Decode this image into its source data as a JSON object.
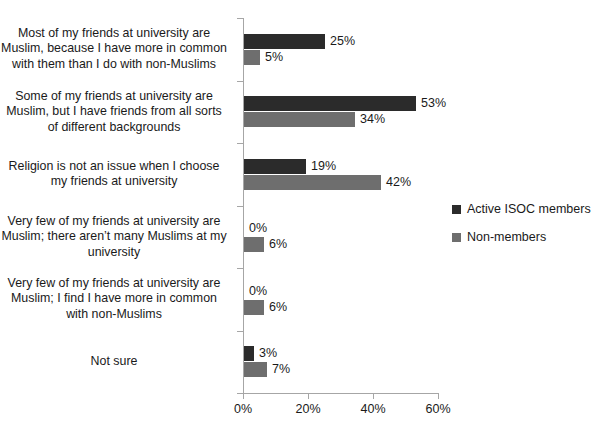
{
  "chart_data": {
    "type": "bar",
    "orientation": "horizontal",
    "title": "",
    "xlabel": "",
    "ylabel": "",
    "xlim": [
      0,
      60
    ],
    "xticks": [
      "0%",
      "20%",
      "40%",
      "60%"
    ],
    "xtick_values": [
      0,
      20,
      40,
      60
    ],
    "grid": false,
    "legend_position": "right",
    "categories": [
      "Most of my friends at university are Muslim, because I have more in common with them than I do with non-Muslims",
      "Some of my friends at university are Muslim, but I have friends from all sorts of different backgrounds",
      "Religion is not an issue when I choose my friends at university",
      "Very few of my friends at university are Muslim; there aren’t many Muslims at my university",
      "Very few of my friends at university are Muslim; I find I have more in common with non-Muslims",
      "Not sure"
    ],
    "series": [
      {
        "name": "Active ISOC members",
        "color": "#2b2b2b",
        "values": [
          25,
          53,
          19,
          0,
          0,
          3
        ],
        "labels": [
          "25%",
          "53%",
          "19%",
          "0%",
          "0%",
          "3%"
        ]
      },
      {
        "name": "Non-members",
        "color": "#6e6e6e",
        "values": [
          5,
          34,
          42,
          6,
          6,
          7
        ],
        "labels": [
          "5%",
          "34%",
          "42%",
          "6%",
          "6%",
          "7%"
        ]
      }
    ]
  },
  "axis": {
    "color": "#a6a6a6"
  },
  "title_sliver": ""
}
